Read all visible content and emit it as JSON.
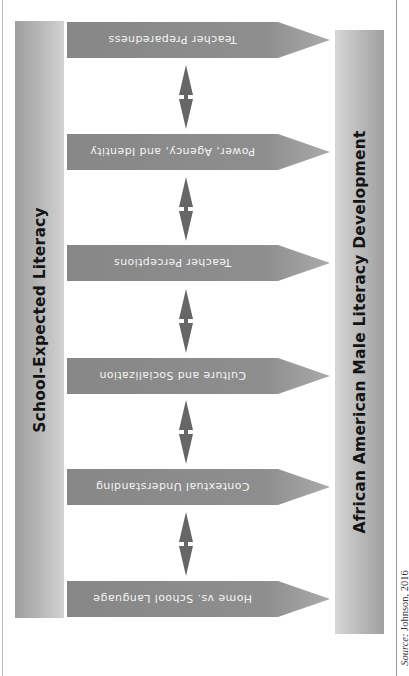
{
  "diagram": {
    "left_bar": {
      "label": "School-Expected Literacy"
    },
    "right_bar": {
      "label": "African American Male Literacy Development"
    },
    "arrows": [
      {
        "label": "Teacher Preparedness",
        "top": 22
      },
      {
        "label": "Power, Agency, and Identity",
        "top": 134
      },
      {
        "label": "Teacher Perceptions",
        "top": 245
      },
      {
        "label": "Culture and Socialization",
        "top": 358
      },
      {
        "label": "Contextual Understanding",
        "top": 469
      },
      {
        "label": "Home vs. School Language",
        "top": 581
      }
    ],
    "connectors": [
      {
        "between": [
          "Teacher Preparedness",
          "Power, Agency, and Identity"
        ],
        "type": "double-arrow"
      },
      {
        "between": [
          "Power, Agency, and Identity",
          "Teacher Perceptions"
        ],
        "type": "double-arrow"
      },
      {
        "between": [
          "Teacher Perceptions",
          "Culture and Socialization"
        ],
        "type": "double-arrow"
      },
      {
        "between": [
          "Culture and Socialization",
          "Contextual Understanding"
        ],
        "type": "double-arrow"
      },
      {
        "between": [
          "Contextual Understanding",
          "Home vs. School Language"
        ],
        "type": "double-arrow"
      }
    ],
    "colors": {
      "arrow_body": "#8a8a8a",
      "arrow_tip": "#a8a8a8",
      "connector": "#666666",
      "arrow_text": "#f4f4f4",
      "bar_text": "#141414"
    }
  },
  "source": {
    "prefix": "Source:",
    "text": " Johnson, 2016"
  }
}
